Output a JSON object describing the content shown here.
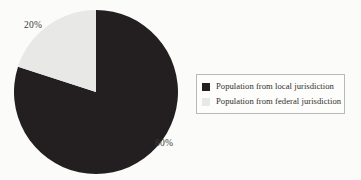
{
  "chart_data": {
    "type": "pie",
    "title": "",
    "categories": [
      "Population from local jurisdiction",
      "Population from federal jurisdiction"
    ],
    "values": [
      80,
      20
    ],
    "value_labels": [
      "80%",
      "20%"
    ],
    "colors": [
      "#231f20",
      "#e8e8e6"
    ],
    "start_angle_deg": 0,
    "direction": "counterclockwise",
    "legend_position": "right",
    "grid": false,
    "slices": [
      {
        "name": "Population from local jurisdiction",
        "value": 80,
        "label": "80%",
        "color": "#231f20"
      },
      {
        "name": "Population from federal jurisdiction",
        "value": 20,
        "label": "20%",
        "color": "#e8e8e6"
      }
    ]
  },
  "legend": {
    "items": [
      {
        "label": "Population from local jurisdiction",
        "color": "#231f20",
        "swatch_name": "legend-swatch-local"
      },
      {
        "label": "Population from federal jurisdiction",
        "color": "#e8e8e6",
        "swatch_name": "legend-swatch-federal"
      }
    ],
    "border_color": "#b9b9b5"
  },
  "page": {
    "background": "#fbfbf9",
    "text_color": "#2e2e2e"
  }
}
